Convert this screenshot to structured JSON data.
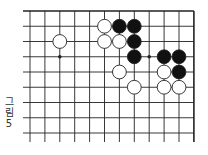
{
  "figure": {
    "caption_chars": [
      "그",
      "림",
      "5"
    ],
    "caption": "그림 5"
  },
  "board": {
    "grid": {
      "x0": 30,
      "y0": 11,
      "dx": 14.9,
      "dy": 15.25,
      "cols": 12,
      "rows": 9,
      "left_extend": 7,
      "bottom_extend": 9,
      "right_edge": true,
      "top_edge": true
    },
    "colors": {
      "line": "#222222",
      "black": "#111111",
      "white": "#ffffff"
    },
    "star_points": [
      [
        2,
        3
      ],
      [
        8,
        3
      ]
    ],
    "stones": [
      {
        "col": 2,
        "row": 2,
        "color": "white"
      },
      {
        "col": 5,
        "row": 1,
        "color": "white"
      },
      {
        "col": 6,
        "row": 1,
        "color": "black"
      },
      {
        "col": 7,
        "row": 1,
        "color": "black"
      },
      {
        "col": 5,
        "row": 2,
        "color": "white"
      },
      {
        "col": 6,
        "row": 2,
        "color": "white"
      },
      {
        "col": 7,
        "row": 2,
        "color": "black"
      },
      {
        "col": 7,
        "row": 3,
        "color": "black"
      },
      {
        "col": 9,
        "row": 3,
        "color": "black"
      },
      {
        "col": 10,
        "row": 3,
        "color": "black"
      },
      {
        "col": 6,
        "row": 4,
        "color": "white"
      },
      {
        "col": 9,
        "row": 4,
        "color": "white"
      },
      {
        "col": 10,
        "row": 4,
        "color": "black"
      },
      {
        "col": 7,
        "row": 5,
        "color": "white"
      },
      {
        "col": 9,
        "row": 5,
        "color": "white"
      },
      {
        "col": 10,
        "row": 5,
        "color": "white"
      }
    ]
  }
}
